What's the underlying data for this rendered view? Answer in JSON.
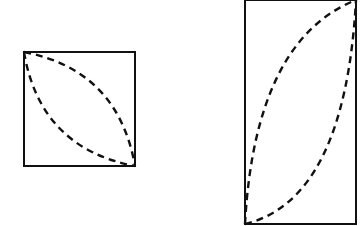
{
  "diagram": {
    "background": "#ffffff",
    "stroke_color": "#111111",
    "shapes": [
      {
        "id": "square",
        "rect": {
          "x": 24,
          "y": 52,
          "width": 111,
          "height": 114
        },
        "dashed_curves": [
          "M24,52 Q118,70 135,166",
          "M24,52 Q40,148 135,166"
        ]
      },
      {
        "id": "tall-rectangle",
        "rect": {
          "x": 245,
          "y": 0,
          "width": 111,
          "height": 224
        },
        "dashed_curves": [
          "M245,224 Q255,40 356,0",
          "M245,224 Q345,200 356,0"
        ]
      }
    ]
  }
}
